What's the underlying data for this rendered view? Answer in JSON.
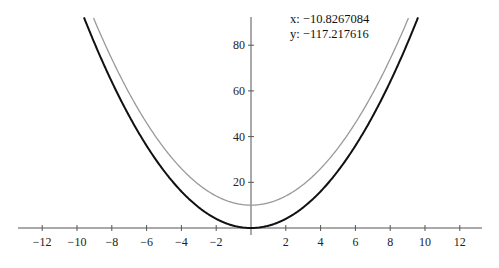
{
  "chart_data": {
    "type": "line",
    "title": "",
    "xlabel": "",
    "ylabel": "",
    "xlim": [
      -13.3,
      13.3
    ],
    "ylim": [
      -1,
      93
    ],
    "x_ticks": [
      -12,
      -10,
      -8,
      -6,
      -4,
      -2,
      2,
      4,
      6,
      8,
      10,
      12
    ],
    "y_ticks": [
      20,
      40,
      60,
      80
    ],
    "grid": false,
    "legend": null,
    "series": [
      {
        "name": "y = x^2",
        "color": "#111111",
        "formula": "x^2",
        "min_point": [
          0,
          0
        ]
      },
      {
        "name": "y = x^2 + 10",
        "color": "#999999",
        "formula": "x^2 + 10",
        "min_point": [
          0,
          10
        ]
      }
    ],
    "annotations": [
      {
        "text": "x: −10.8267084"
      },
      {
        "text": "y: −117.217616"
      }
    ]
  },
  "readout": {
    "x_label": "x: −10.8267084",
    "y_label": "y: −117.217616"
  },
  "axes": {
    "x_tick_labels": [
      "−12",
      "−10",
      "−8",
      "−6",
      "−4",
      "−2",
      "2",
      "4",
      "6",
      "8",
      "10",
      "12"
    ],
    "y_tick_labels": [
      "20",
      "40",
      "60",
      "80"
    ]
  }
}
